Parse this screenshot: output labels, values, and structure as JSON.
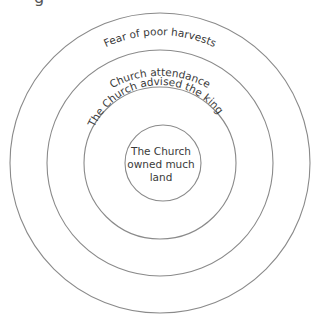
{
  "diagram": {
    "type": "concentric-circles",
    "partial_heading_fragment": "g",
    "rings": [
      {
        "label": "Fear of poor harvests",
        "level": "outermost"
      },
      {
        "label": "Church attendance",
        "level": "second"
      },
      {
        "label": "The Church advised the king",
        "level": "third"
      },
      {
        "label_lines": [
          "The Church",
          "owned much",
          "land"
        ],
        "level": "center"
      }
    ],
    "colors": {
      "stroke": "#8a8a8a",
      "text": "#3a3a3a",
      "background": "#ffffff"
    }
  }
}
